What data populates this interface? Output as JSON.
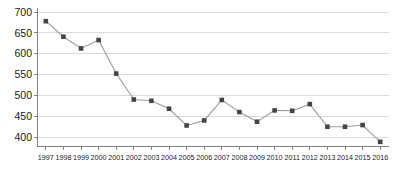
{
  "chart_data": {
    "type": "line",
    "title": "",
    "subtitle": "",
    "xlabel": "",
    "ylabel": "",
    "grid": true,
    "legend": false,
    "legend_position": "none",
    "xlim": [
      1996.5,
      2016.5
    ],
    "ylim": [
      380,
      700
    ],
    "yticks": [
      400,
      450,
      500,
      550,
      600,
      650,
      700
    ],
    "ytick_labels": [
      "400",
      "450",
      "500",
      "550",
      "600",
      "650",
      "700"
    ],
    "categories": [
      "1997",
      "1998",
      "1999",
      "2000",
      "2001",
      "2002",
      "2003",
      "2004",
      "2005",
      "2006",
      "2007",
      "2008",
      "2009",
      "2010",
      "2011",
      "2012",
      "2013",
      "2014",
      "2015",
      "2016"
    ],
    "x": [
      1997,
      1998,
      1999,
      2000,
      2001,
      2002,
      2003,
      2004,
      2005,
      2006,
      2007,
      2008,
      2009,
      2010,
      2011,
      2012,
      2013,
      2014,
      2015,
      2016
    ],
    "values": [
      678,
      641,
      613,
      633,
      553,
      491,
      488,
      469,
      429,
      441,
      490,
      461,
      438,
      465,
      464,
      480,
      426,
      426,
      430,
      390
    ],
    "series": [
      {
        "name": "series-1",
        "values": [
          678,
          641,
          613,
          633,
          553,
          491,
          488,
          469,
          429,
          441,
          490,
          461,
          438,
          465,
          464,
          480,
          426,
          426,
          430,
          390
        ],
        "line_color": "#9a9a9a",
        "marker_color": "#454545",
        "marker": "square"
      }
    ],
    "colors": {
      "gridline": "#d9d9d9",
      "axis": "#808080",
      "line": "#9a9a9a",
      "marker": "#454545",
      "text": "#1a1a1a",
      "background": "#ffffff"
    }
  }
}
